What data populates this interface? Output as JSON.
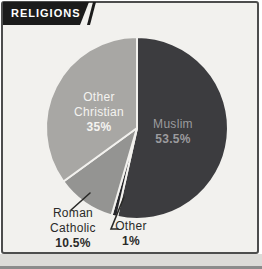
{
  "header": {
    "title": "RELIGIONS"
  },
  "chart_data": {
    "type": "pie",
    "title": "RELIGIONS",
    "direction": "clockwise",
    "start_angle_deg": 0,
    "legend": "none",
    "labels_on_chart": true,
    "divider_color": "#f2f1ee",
    "slices": [
      {
        "label": "Muslim",
        "value": 53.5,
        "display": "53.5%",
        "color": "#3c3c3f",
        "label_color": "#9b9b9e",
        "label_placement": "inside"
      },
      {
        "label": "Other",
        "value": 1,
        "display": "1%",
        "color": "#26262a",
        "label_color": "#2a2a28",
        "label_placement": "outside"
      },
      {
        "label": "Roman Catholic",
        "value": 10.5,
        "display": "10.5%",
        "color": "#949492",
        "label_color": "#2a2a28",
        "label_placement": "outside"
      },
      {
        "label": "Other Christian",
        "value": 35,
        "display": "35%",
        "color": "#a8a7a4",
        "label_color": "#f4f3f0",
        "label_placement": "inside"
      }
    ],
    "frame": {
      "border_color": "#4d4d4d",
      "background": "#f2f1ee"
    }
  }
}
